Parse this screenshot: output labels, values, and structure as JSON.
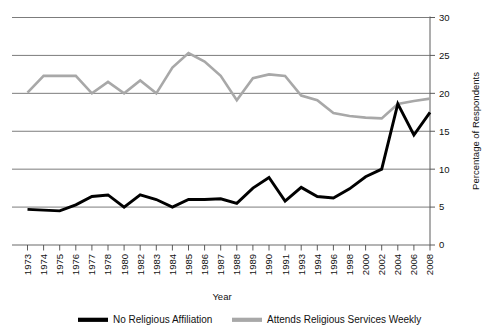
{
  "chart_data": {
    "type": "line",
    "title": "",
    "xlabel": "Year",
    "ylabel": "Percentage of Respondents",
    "ylim": [
      0,
      30
    ],
    "yticks": [
      0,
      5,
      10,
      15,
      20,
      25,
      30
    ],
    "grid": true,
    "y_axis_position": "right",
    "legend_position": "bottom",
    "categories": [
      "1973",
      "1974",
      "1975",
      "1976",
      "1977",
      "1978",
      "1980",
      "1982",
      "1983",
      "1984",
      "1985",
      "1986",
      "1987",
      "1988",
      "1989",
      "1990",
      "1991",
      "1993",
      "1994",
      "1996",
      "1998",
      "2000",
      "2002",
      "2004",
      "2006",
      "2008"
    ],
    "series": [
      {
        "name": "No Religious Affiliation",
        "color": "#000000",
        "values": [
          4.7,
          4.6,
          4.5,
          5.3,
          6.4,
          6.6,
          5.0,
          6.6,
          6.0,
          5.0,
          6.0,
          6.0,
          6.1,
          5.5,
          7.5,
          8.9,
          5.8,
          7.6,
          6.4,
          6.2,
          7.4,
          9.0,
          10.0,
          18.6,
          14.5,
          17.5
        ]
      },
      {
        "name": "Attends Religious Services Weekly",
        "color": "#a8a8a8",
        "values": [
          20.1,
          22.3,
          22.3,
          22.3,
          20.0,
          21.5,
          20.0,
          21.7,
          20.0,
          23.4,
          25.3,
          24.2,
          22.3,
          19.1,
          22.0,
          22.5,
          22.3,
          19.7,
          19.1,
          17.4,
          17.0,
          16.8,
          16.7,
          18.6,
          19.0,
          19.3
        ]
      }
    ]
  },
  "axes": {
    "y_title": "Percentage of Respondents",
    "x_title": "Year"
  },
  "legend": {
    "items": [
      {
        "label": "No Religious Affiliation",
        "color": "#000000",
        "width": 4.2
      },
      {
        "label": "Attends Religious Services Weekly",
        "color": "#a8a8a8",
        "width": 4.2
      }
    ]
  }
}
